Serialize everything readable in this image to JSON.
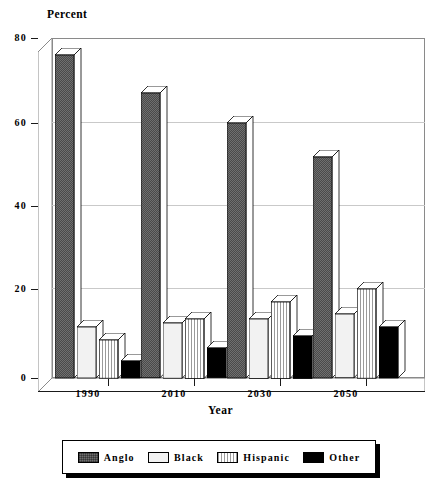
{
  "chart_data": {
    "type": "bar",
    "title": "",
    "ylabel": "Percent",
    "xlabel": "Year",
    "categories": [
      "1990",
      "2010",
      "2030",
      "2050"
    ],
    "ylim": [
      0,
      80
    ],
    "yticks": [
      0,
      20,
      40,
      60,
      80
    ],
    "ytick_labels": [
      "0",
      "20",
      "40",
      "60",
      "80"
    ],
    "grid": true,
    "legend_position": "bottom",
    "style": "3d-bar",
    "series": [
      {
        "name": "Anglo",
        "color": "#6f6f6f",
        "pattern": "checker",
        "values": [
          76,
          67,
          60,
          52
        ]
      },
      {
        "name": "Black",
        "color": "#f2f2f2",
        "pattern": "solid",
        "values": [
          12,
          13,
          14,
          15
        ]
      },
      {
        "name": "Hispanic",
        "color": "#ffffff",
        "pattern": "vstripes",
        "values": [
          9,
          14,
          18,
          21
        ]
      },
      {
        "name": "Other",
        "color": "#000000",
        "pattern": "solid",
        "values": [
          4,
          7,
          10,
          12
        ]
      }
    ]
  },
  "axis": {
    "y_title": "Percent",
    "x_title": "Year",
    "y_labels": [
      "80",
      "60",
      "40",
      "20",
      "0"
    ],
    "x_labels": [
      "1990",
      "2010",
      "2030",
      "2050"
    ]
  },
  "legend": {
    "items": [
      {
        "label": "Anglo"
      },
      {
        "label": "Black"
      },
      {
        "label": "Hispanic"
      },
      {
        "label": "Other"
      }
    ]
  }
}
